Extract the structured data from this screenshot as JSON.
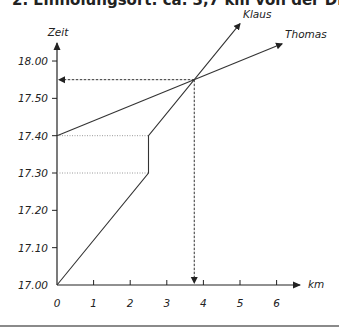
{
  "title": "2. Einholungsort: ca. 3,7 km von der Disco entfernt",
  "chart_data": {
    "type": "line",
    "title": "2. Einholungsort: ca. 3,7 km von der Disco entfernt",
    "xlabel": "km",
    "ylabel": "Zeit",
    "x_ticks": [
      0,
      1,
      2,
      3,
      4,
      5,
      6
    ],
    "x_tick_labels": [
      "0",
      "1",
      "2",
      "3",
      "4",
      "5",
      "6"
    ],
    "y_ticks_minutes": [
      0,
      10,
      20,
      30,
      40,
      50,
      60
    ],
    "y_tick_labels": [
      "17.00",
      "17.10",
      "17.20",
      "17.30",
      "17.40",
      "17.50",
      "18.00"
    ],
    "xlim": [
      0,
      6.6
    ],
    "ylim_minutes_after_1700": [
      0,
      67
    ],
    "grid": false,
    "legend": "inline labels at line ends",
    "series": [
      {
        "name": "Klaus",
        "points_km_min": [
          [
            0,
            0
          ],
          [
            2.5,
            30
          ],
          [
            2.5,
            40
          ],
          [
            5.0,
            70
          ]
        ],
        "note": "Startet 17.00, Pause bei 2,5 km von 17.30 bis 17.40"
      },
      {
        "name": "Thomas",
        "points_km_min": [
          [
            0,
            40
          ],
          [
            6.15,
            64.6
          ]
        ],
        "note": "Startet 17.40"
      }
    ],
    "guides": [
      {
        "type": "dotted",
        "from_km_min": [
          0,
          40
        ],
        "to_km_min": [
          2.5,
          40
        ]
      },
      {
        "type": "dotted",
        "from_km_min": [
          0,
          30
        ],
        "to_km_min": [
          2.5,
          30
        ]
      }
    ],
    "annotations": [
      {
        "type": "arrow-dashed",
        "from_km_min": [
          3.75,
          55
        ],
        "to_km_min": [
          0,
          55
        ],
        "meaning": "Einholzeit ca. 17.55"
      },
      {
        "type": "arrow-dashed",
        "from_km_min": [
          3.75,
          55
        ],
        "to_km_min": [
          3.75,
          0
        ],
        "meaning": "Einholort ca. 3,75 km"
      }
    ],
    "intersection": {
      "km": 3.75,
      "time": "17.55"
    }
  },
  "layout": {
    "origin_px": [
      57,
      285
    ],
    "px_per_km": 36.6,
    "px_per_min": 3.733,
    "x_axis_end_px": 300,
    "y_axis_end_px": 43
  },
  "colors": {
    "axis": "#222222",
    "line": "#333333",
    "guide": "#9a9a9a",
    "arrow_dashed": "#333333",
    "rule": "#8a8a8a"
  }
}
